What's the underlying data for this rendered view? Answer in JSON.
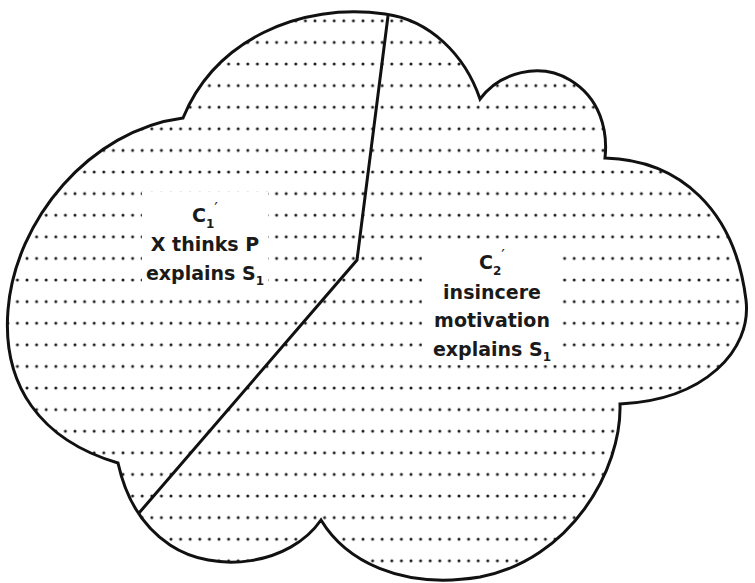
{
  "diagram": {
    "type": "cloud-partition",
    "stroke_color": "#111111",
    "dot_color": "#1a1a1a",
    "background": "#ffffff",
    "regions": [
      {
        "id": "C1",
        "symbol": "C",
        "subscript": "1",
        "prime": "′",
        "lines": [
          "X thinks P",
          "explains S"
        ],
        "last_line_subscript": "1"
      },
      {
        "id": "C2",
        "symbol": "C",
        "subscript": "2",
        "prime": "′",
        "lines": [
          "insincere",
          "motivation",
          "explains S"
        ],
        "last_line_subscript": "1"
      }
    ],
    "divider": {
      "points": [
        [
          388,
          16
        ],
        [
          357,
          260
        ],
        [
          139,
          513
        ]
      ]
    }
  }
}
